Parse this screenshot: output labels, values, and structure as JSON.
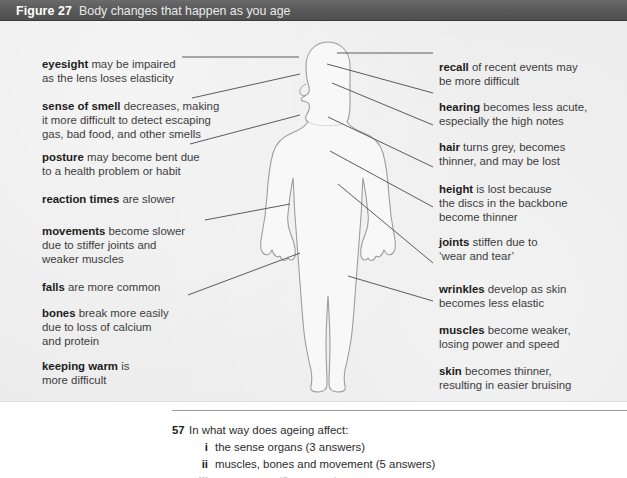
{
  "caption": {
    "label": "Figure 27",
    "title": "Body changes that happen as you age"
  },
  "figure": {
    "colors": {
      "caption_bar": "#55555 5",
      "panel_background": "#ececed",
      "body_fill": "#f7f7f7",
      "body_outline": "#9a9a9a",
      "leader_line": "#4a4a4a",
      "body_text": "#3c3c3c",
      "term_text": "#1c1c1c"
    },
    "left_annotations": [
      {
        "term": "eyesight",
        "text": " may be impaired\nas the lens loses elasticity"
      },
      {
        "term": "sense of smell",
        "text": " decreases, making\nit more difficult to detect escaping\ngas, bad food, and other smells"
      },
      {
        "term": "posture",
        "text": " may become bent due\nto a health problem or habit"
      },
      {
        "term": "reaction times",
        "text": " are slower"
      },
      {
        "term": "movements",
        "text": " become slower\ndue to stiffer joints and\nweaker muscles"
      },
      {
        "term": "falls",
        "text": " are more common"
      },
      {
        "term": "bones",
        "text": " break more easily\ndue to loss of calcium\nand protein"
      },
      {
        "term": "keeping warm",
        "text": " is\nmore difficult"
      }
    ],
    "right_annotations": [
      {
        "term": "recall",
        "text": " of recent events may\nbe more difficult"
      },
      {
        "term": "hearing",
        "text": " becomes less acute,\nespecially the high notes"
      },
      {
        "term": "hair",
        "text": " turns grey, becomes\nthinner, and may be lost"
      },
      {
        "term": "height",
        "text": " is lost because\nthe discs in the backbone\nbecome thinner"
      },
      {
        "term": "joints",
        "text": " stiffen due to\n‘wear and tear’"
      },
      {
        "term": "wrinkles",
        "text": " develop as skin\nbecomes less elastic"
      },
      {
        "term": "muscles",
        "text": " become weaker,\nlosing power and speed"
      },
      {
        "term": "skin",
        "text": " becomes thinner,\nresulting in easier bruising"
      }
    ]
  },
  "question": {
    "number": "57",
    "stem": "In what way does ageing affect:",
    "items": [
      {
        "marker": "i",
        "text": "the sense organs (3 answers)"
      },
      {
        "marker": "ii",
        "text": "muscles, bones and movement (5 answers)"
      },
      {
        "marker": "iii",
        "text": "appearance (3 answers)"
      }
    ]
  }
}
